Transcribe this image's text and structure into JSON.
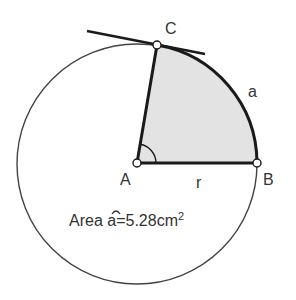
{
  "diagram": {
    "points": {
      "A": {
        "label": "A",
        "x": 137,
        "y": 163
      },
      "B": {
        "label": "B",
        "x": 257,
        "y": 163
      },
      "C": {
        "label": "C",
        "x": 157,
        "y": 45
      }
    },
    "labels": {
      "arc": "a",
      "radius": "r",
      "area_prefix": "Area ",
      "area_symbol": "a",
      "area_equals": "=5.28cm",
      "area_exp": "2"
    },
    "colors": {
      "sector_fill": "#e3e3e3",
      "stroke": "#1a1a1a",
      "circle_stroke": "#444444"
    }
  }
}
